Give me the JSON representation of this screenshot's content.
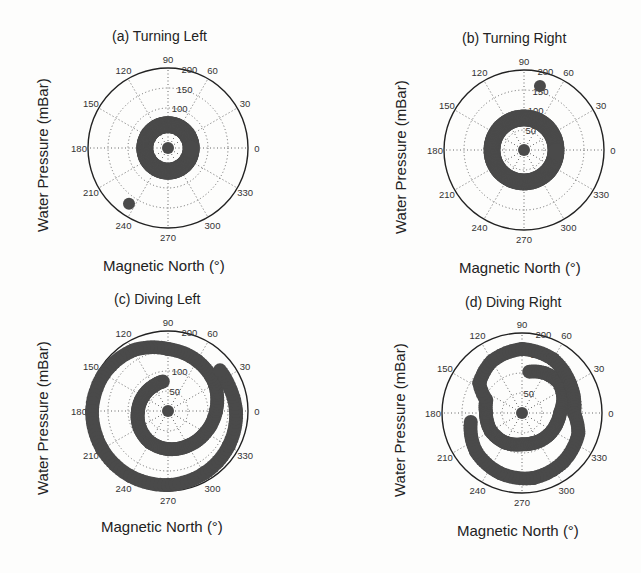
{
  "figure": {
    "ylabel": "Water Pressure (mBar)",
    "xlabel": "Magnetic North (°)"
  },
  "chart_data": [
    {
      "type": "scatter",
      "subtype": "polar",
      "title": "(a)   Turning Left",
      "xlabel": "Magnetic North (°)",
      "ylabel": "Water Pressure (mBar)",
      "angular_ticks": [
        "0",
        "30",
        "60",
        "90",
        "120",
        "150",
        "180",
        "210",
        "240",
        "270",
        "300",
        "330"
      ],
      "radial_ticks": [
        "50",
        "100",
        "150",
        "200"
      ],
      "rlim": [
        0,
        200
      ],
      "grid": true,
      "description": "Single ring of points at radius ~40–80 mBar around the full circle, one point at center, one outlier near 235° at ~170 mBar",
      "series": [
        {
          "name": "center",
          "points": [
            [
              0,
              0
            ]
          ]
        },
        {
          "name": "ring",
          "r_range": [
            38,
            78
          ],
          "theta_range": [
            0,
            360
          ]
        },
        {
          "name": "outlier",
          "points": [
            [
              235,
              170
            ]
          ]
        }
      ]
    },
    {
      "type": "scatter",
      "subtype": "polar",
      "title": "(b)   Turning Right",
      "xlabel": "Magnetic North (°)",
      "ylabel": "Water Pressure (mBar)",
      "angular_ticks": [
        "0",
        "30",
        "60",
        "90",
        "120",
        "150",
        "180",
        "210",
        "240",
        "270",
        "300",
        "330"
      ],
      "radial_ticks": [
        "50",
        "100",
        "150",
        "200"
      ],
      "rlim": [
        0,
        200
      ],
      "grid": true,
      "description": "Uniform ring at radius ~60–100 mBar around the full circle, point at center, outlier near 75° at ~165 mBar",
      "series": [
        {
          "name": "center",
          "points": [
            [
              0,
              0
            ]
          ]
        },
        {
          "name": "ring",
          "r_range": [
            60,
            100
          ],
          "theta_range": [
            0,
            360
          ]
        },
        {
          "name": "outlier",
          "points": [
            [
              76,
              165
            ]
          ]
        }
      ]
    },
    {
      "type": "scatter",
      "subtype": "polar",
      "title": "(c)   Diving Left",
      "xlabel": "Magnetic North (°)",
      "ylabel": "Water Pressure (mBar)",
      "angular_ticks": [
        "0",
        "30",
        "60",
        "90",
        "120",
        "150",
        "180",
        "210",
        "240",
        "270",
        "300",
        "330"
      ],
      "radial_ticks": [
        "50",
        "100",
        "150",
        "200"
      ],
      "rlim": [
        0,
        200
      ],
      "grid": true,
      "description": "Outward spiral: pressure increases from ~75 mBar at 90° counter-clockwise around through 180°, 270°, 360° reaching ~190 mBar, continuing to ~60° near 150 mBar",
      "series": [
        {
          "name": "center",
          "points": [
            [
              0,
              0
            ]
          ]
        },
        {
          "name": "spiral",
          "points": [
            [
              100,
              75
            ],
            [
              120,
              72
            ],
            [
              150,
              72
            ],
            [
              180,
              75
            ],
            [
              210,
              82
            ],
            [
              240,
              90
            ],
            [
              270,
              95
            ],
            [
              300,
              100
            ],
            [
              330,
              108
            ],
            [
              360,
              120
            ],
            [
              390,
              135
            ],
            [
              420,
              145
            ],
            [
              450,
              155
            ],
            [
              480,
              175
            ],
            [
              510,
              185
            ],
            [
              540,
              190
            ],
            [
              570,
              190
            ],
            [
              600,
              188
            ],
            [
              630,
              185
            ],
            [
              660,
              180
            ],
            [
              690,
              175
            ],
            [
              720,
              170
            ],
            [
              740,
              165
            ],
            [
              760,
              165
            ]
          ]
        }
      ]
    },
    {
      "type": "scatter",
      "subtype": "polar",
      "title": "(d)   Diving Right",
      "xlabel": "Magnetic North (°)",
      "ylabel": "Water Pressure (mBar)",
      "angular_ticks": [
        "0",
        "30",
        "60",
        "90",
        "120",
        "150",
        "180",
        "210",
        "240",
        "270",
        "300",
        "330"
      ],
      "radial_ticks": [
        "50",
        "100",
        "150",
        "200"
      ],
      "rlim": [
        0,
        200
      ],
      "grid": true,
      "description": "Clockwise inward/outward spiral arcs concentrated in lower half (radius ~70–170 mBar) with scattered clusters in upper half at ~110–160 mBar",
      "series": [
        {
          "name": "center",
          "points": [
            [
              0,
              0
            ]
          ]
        },
        {
          "name": "spiral",
          "points": [
            [
              80,
              105
            ],
            [
              60,
              115
            ],
            [
              40,
              120
            ],
            [
              20,
              110
            ],
            [
              0,
              95
            ],
            [
              -20,
              90
            ],
            [
              -45,
              85
            ],
            [
              -70,
              80
            ],
            [
              -90,
              78
            ],
            [
              -120,
              85
            ],
            [
              -150,
              90
            ],
            [
              -180,
              90
            ],
            [
              -200,
              95
            ],
            [
              -215,
              130
            ],
            [
              -240,
              150
            ],
            [
              -270,
              160
            ],
            [
              -300,
              155
            ],
            [
              -330,
              140
            ],
            [
              -360,
              130
            ],
            [
              -380,
              150
            ],
            [
              -410,
              160
            ],
            [
              -440,
              165
            ],
            [
              -470,
              160
            ],
            [
              -500,
              150
            ],
            [
              -530,
              130
            ]
          ]
        }
      ]
    }
  ]
}
